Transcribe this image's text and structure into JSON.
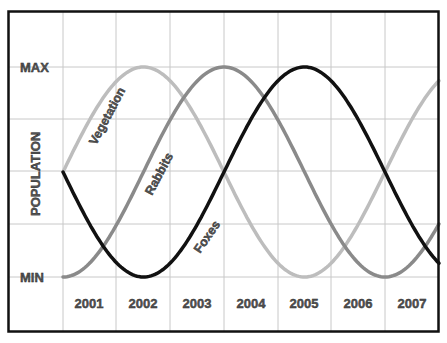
{
  "chart_data": {
    "type": "line",
    "title": "",
    "xlabel": "",
    "ylabel": "POPULATION",
    "categories": [
      "2001",
      "2002",
      "2003",
      "2004",
      "2005",
      "2006",
      "2007"
    ],
    "y_ticks": [
      "MAX",
      "MIN"
    ],
    "ylim": [
      "MIN",
      "MAX"
    ],
    "grid": true,
    "legend": "inline labels on curves",
    "series": [
      {
        "name": "Vegetation",
        "color": "#bdbdbd",
        "description": "starts at mid level rising, peaks mid-2002, minimum around 2005-2006, rising toward 2007",
        "values_normalized": [
          0.5,
          0.99,
          0.75,
          0.1,
          0.02,
          0.45,
          0.92
        ]
      },
      {
        "name": "Rabbits",
        "color": "#8a8a8a",
        "description": "starts at MIN, peaks around 2004, minimum around 2006-2007",
        "values_normalized": [
          0.02,
          0.45,
          0.92,
          0.98,
          0.55,
          0.08,
          0.1
        ]
      },
      {
        "name": "Foxes",
        "color": "#111111",
        "description": "starts at mid level falling, minimum mid-2002, peaks mid-2005, falling toward end",
        "values_normalized": [
          0.5,
          0.01,
          0.25,
          0.9,
          0.98,
          0.55,
          0.08
        ]
      }
    ]
  },
  "labels": {
    "max": "MAX",
    "min": "MIN",
    "ylabel": "POPULATION",
    "years": [
      "2001",
      "2002",
      "2003",
      "2004",
      "2005",
      "2006",
      "2007"
    ],
    "series": [
      "Vegetation",
      "Rabbits",
      "Foxes"
    ]
  }
}
